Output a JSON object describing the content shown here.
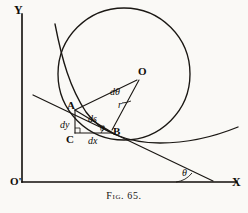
{
  "figure": {
    "caption_prefix": "Fig.",
    "caption_number": "65.",
    "caption_full": "Fig. 65."
  },
  "axes": {
    "y_label": "Y",
    "x_label": "X",
    "origin_label": "O'"
  },
  "points": {
    "center_label": "O",
    "a_label": "A",
    "b_label": "B",
    "c_label": "C"
  },
  "annotations": {
    "radius_label": "r",
    "d_theta_label": "dθ",
    "ds_label": "ds",
    "dx_label": "dx",
    "dy_label": "dy",
    "theta_triangle_label": "θ",
    "theta_axis_label": "θ"
  },
  "colors": {
    "ink": "#100d0a",
    "paper": "#faf9f6",
    "line": "#1a1713"
  }
}
